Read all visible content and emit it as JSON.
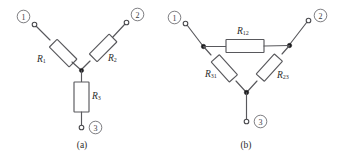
{
  "figure": {
    "background_color": "#ffffff",
    "line_color": "#58585c",
    "node_color": "#1d1d1f"
  },
  "panels": [
    {
      "id": "panel-a",
      "caption": "(a)",
      "network_type": "wye-star",
      "terminals": [
        {
          "id": "terminal-1",
          "label": "1"
        },
        {
          "id": "terminal-2",
          "label": "2"
        },
        {
          "id": "terminal-3",
          "label": "3"
        }
      ],
      "resistors": [
        {
          "id": "resistor-r1",
          "symbol": "R",
          "subscript": "1"
        },
        {
          "id": "resistor-r2",
          "symbol": "R",
          "subscript": "2"
        },
        {
          "id": "resistor-r3",
          "symbol": "R",
          "subscript": "3"
        }
      ]
    },
    {
      "id": "panel-b",
      "caption": "(b)",
      "network_type": "delta-triangle",
      "terminals": [
        {
          "id": "terminal-1",
          "label": "1"
        },
        {
          "id": "terminal-2",
          "label": "2"
        },
        {
          "id": "terminal-3",
          "label": "3"
        }
      ],
      "resistors": [
        {
          "id": "resistor-r12",
          "symbol": "R",
          "subscript": "12"
        },
        {
          "id": "resistor-r31",
          "symbol": "R",
          "subscript": "31"
        },
        {
          "id": "resistor-r23",
          "symbol": "R",
          "subscript": "23"
        }
      ]
    }
  ]
}
